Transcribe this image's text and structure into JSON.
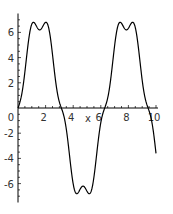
{
  "chart_data": {
    "type": "line",
    "title": "",
    "xlabel": "x",
    "ylabel": "",
    "xlim": [
      0,
      10
    ],
    "ylim": [
      -7.5,
      7.5
    ],
    "grid": false,
    "legend": null,
    "x_ticks": [
      0,
      2,
      4,
      6,
      8,
      10
    ],
    "x_tick_labels": [
      "0",
      "2",
      "4",
      "6",
      "8",
      "10"
    ],
    "y_ticks": [
      -6,
      -4,
      -2,
      0,
      2,
      4,
      6
    ],
    "y_tick_labels": [
      "-6",
      "-4",
      "-2",
      "0",
      "2",
      "4",
      "6"
    ],
    "line_color": "#000000",
    "series": [
      {
        "name": "f(x)",
        "x": [
          0,
          0.1,
          0.2,
          0.3,
          0.4,
          0.5,
          0.6,
          0.7,
          0.8,
          0.9,
          1.0,
          1.1,
          1.2,
          1.3,
          1.4,
          1.5,
          1.6,
          1.7,
          1.8,
          1.9,
          2.0,
          2.1,
          2.2,
          2.3,
          2.4,
          2.5,
          2.6,
          2.7,
          2.8,
          2.9,
          3.0,
          3.1,
          3.2,
          3.3,
          3.4,
          3.5,
          3.6,
          3.7,
          3.8,
          3.9,
          4.0,
          4.1,
          4.2,
          4.3,
          4.4,
          4.5,
          4.6,
          4.7,
          4.8,
          4.9,
          5.0,
          5.1,
          5.2,
          5.3,
          5.4,
          5.5,
          5.6,
          5.7,
          5.8,
          5.9,
          6.0,
          6.1,
          6.2,
          6.3,
          6.4,
          6.5,
          6.6,
          6.7,
          6.8,
          6.9,
          7.0,
          7.1,
          7.2,
          7.3,
          7.4,
          7.5,
          7.6,
          7.7,
          7.8,
          7.9,
          8.0,
          8.1,
          8.2,
          8.3,
          8.4,
          8.5,
          8.6,
          8.7,
          8.8,
          8.9,
          9.0,
          9.1,
          9.2,
          9.3,
          9.4,
          9.5,
          9.6,
          9.7,
          9.8,
          9.9,
          10.0
        ],
        "y": [
          0,
          1.0,
          2.1,
          2.8,
          3.0,
          3.0,
          3.1,
          3.6,
          4.6,
          5.7,
          6.6,
          7.2,
          7.3,
          7.0,
          6.5,
          6.2,
          6.2,
          6.6,
          7.1,
          7.3,
          7.2,
          6.7,
          5.8,
          4.7,
          3.8,
          3.2,
          3.0,
          3.0,
          2.9,
          2.3,
          1.2,
          0.1,
          -1.0,
          -2.1,
          -2.8,
          -3.0,
          -3.0,
          -3.1,
          -3.6,
          -4.6,
          -5.7,
          -6.6,
          -7.2,
          -7.3,
          -7.0,
          -6.5,
          -6.2,
          -6.2,
          -6.6,
          -7.1,
          -7.3,
          -7.2,
          -6.7,
          -5.8,
          -4.7,
          -3.8,
          -3.2,
          -3.0,
          -3.0,
          -2.9,
          -2.3,
          -1.2,
          -0.1,
          0.1,
          1.0,
          2.1,
          2.8,
          3.0,
          3.0,
          3.1,
          3.6,
          4.6,
          5.7,
          6.6,
          7.2,
          7.3,
          7.0,
          6.5,
          6.2,
          6.2,
          6.6,
          7.1,
          7.3,
          7.2,
          6.7,
          5.8,
          4.7,
          3.8,
          3.2,
          3.0,
          3.0,
          2.9,
          2.3,
          1.2,
          0.1,
          -1.0,
          -2.1,
          -2.8,
          -3.0,
          -3.0,
          -3.0
        ]
      }
    ]
  }
}
